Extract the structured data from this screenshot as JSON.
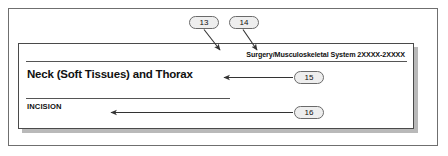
{
  "figure": {
    "type": "annotated-document-illustration",
    "document_card": {
      "running_header": "Surgery/Musculoskeletal System 2XXXX-2XXXX",
      "chapter_title": "Neck (Soft Tissues) and Thorax",
      "subheading": "INCISION"
    },
    "callouts": [
      {
        "id": "13",
        "label": "13",
        "points_to": "running-header-section-name"
      },
      {
        "id": "14",
        "label": "14",
        "points_to": "running-header-code-range"
      },
      {
        "id": "15",
        "label": "15",
        "points_to": "chapter-title"
      },
      {
        "id": "16",
        "label": "16",
        "points_to": "subheading-incision"
      }
    ],
    "colors": {
      "page_background": "#ffffff",
      "frame_border": "#6f6f6f",
      "card_border": "#4a4a4a",
      "card_shadow": "#b9b9b9",
      "callout_fill": "#eeeeee",
      "callout_border": "#6a6a6a",
      "text": "#111111",
      "rule": "#555555"
    }
  }
}
